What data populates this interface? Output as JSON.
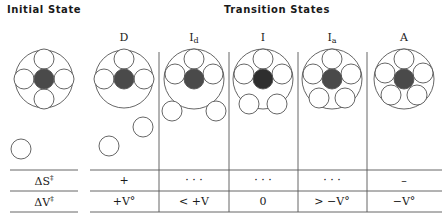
{
  "headers": {
    "initial_state": "Initial State",
    "transition_states": "Transition States"
  },
  "columns": [
    {
      "key": "D",
      "label": "D",
      "subscript": "",
      "x": 124
    },
    {
      "key": "Id",
      "label": "I",
      "subscript": "d",
      "x": 194
    },
    {
      "key": "I",
      "label": "I",
      "subscript": "",
      "x": 263
    },
    {
      "key": "Ia",
      "label": "I",
      "subscript": "a",
      "x": 332
    },
    {
      "key": "A",
      "label": "A",
      "subscript": "",
      "x": 404
    }
  ],
  "rows": [
    {
      "label": "ΔS",
      "label_sup": "‡",
      "values": [
        "+",
        "· · ·",
        "· · ·",
        "· · ·",
        "–"
      ]
    },
    {
      "label": "ΔV",
      "label_sup": "‡",
      "values": [
        "+V°",
        "< +V",
        "0",
        "> −V°",
        "−V°"
      ]
    }
  ],
  "colors": {
    "line": "#555555",
    "metal_fill": "#4a4a4a",
    "ligand_fill": "#ffffff"
  },
  "diagram_description": {
    "initial": "Metal (dark) with 4 coordinated ligands inside coordination sphere; free incoming ligand below",
    "D": "Dissociative: 3 ligands in sphere, 2 ligands far outside",
    "Id": "Dissociative interchange: 3 ligands in sphere, 2 ligands at edge outside",
    "I": "Interchange: 3 ligands top, 2 ligands at sphere boundary",
    "Ia": "Associative interchange: 5 ligands mostly inside sphere",
    "A": "Associative: 5 ligands fully inside coordination sphere"
  }
}
